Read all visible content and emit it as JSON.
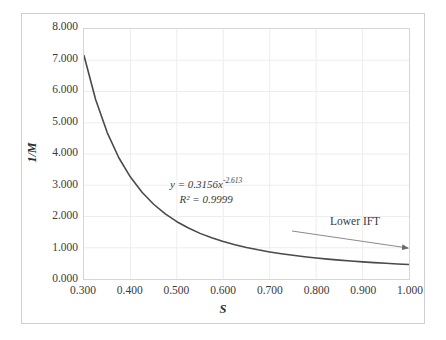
{
  "chart_data": {
    "type": "line",
    "title": "",
    "subtitle": "",
    "xlabel": "S",
    "ylabel": "1/M",
    "xlim": [
      0.3,
      1.0
    ],
    "ylim": [
      0.0,
      8.0
    ],
    "x_ticks": [
      "0.300",
      "0.400",
      "0.500",
      "0.600",
      "0.700",
      "0.800",
      "0.900",
      "1.000"
    ],
    "x_tick_values": [
      0.3,
      0.4,
      0.5,
      0.6,
      0.7,
      0.8,
      0.9,
      1.0
    ],
    "y_ticks": [
      "0.000",
      "1.000",
      "2.000",
      "3.000",
      "4.000",
      "5.000",
      "6.000",
      "7.000",
      "8.000"
    ],
    "y_tick_values": [
      0.0,
      1.0,
      2.0,
      3.0,
      4.0,
      5.0,
      6.0,
      7.0,
      8.0
    ],
    "grid": true,
    "legend": false,
    "series": [
      {
        "name": "1/M vs S",
        "color": "#4a4a4a",
        "fit_type": "power",
        "fit_coefficient": 0.3156,
        "fit_exponent": -2.613,
        "r_squared": 0.9999,
        "x": [
          0.3,
          0.325,
          0.35,
          0.375,
          0.4,
          0.425,
          0.45,
          0.475,
          0.5,
          0.525,
          0.55,
          0.575,
          0.6,
          0.625,
          0.65,
          0.675,
          0.7,
          0.725,
          0.75,
          0.775,
          0.8,
          0.825,
          0.85,
          0.875,
          0.9,
          0.925,
          0.95,
          0.975,
          1.0
        ],
        "values": [
          7.15,
          5.742,
          4.685,
          3.881,
          3.261,
          2.776,
          2.392,
          2.084,
          1.834,
          1.63,
          1.46,
          1.318,
          1.199,
          1.097,
          1.009,
          0.933,
          0.867,
          0.809,
          0.758,
          0.713,
          0.673,
          0.637,
          0.604,
          0.575,
          0.548,
          0.524,
          0.502,
          0.481,
          0.463
        ]
      }
    ],
    "annotations": [
      {
        "name": "equation",
        "equation_line1_prefix": "y = 0.3156x",
        "equation_line1_exponent": "-2.613",
        "equation_line2": "R² = 0.9999"
      },
      {
        "name": "lower-ift",
        "text": "Lower IFT",
        "arrow_direction": "right-down"
      }
    ],
    "colors": {
      "curve": "#4a4a4a",
      "grid": "#ededed",
      "plot_border": "#d6d6d6",
      "outer_frame": "#cfcfcf",
      "text": "#3a3a3a",
      "background": "#ffffff"
    }
  }
}
